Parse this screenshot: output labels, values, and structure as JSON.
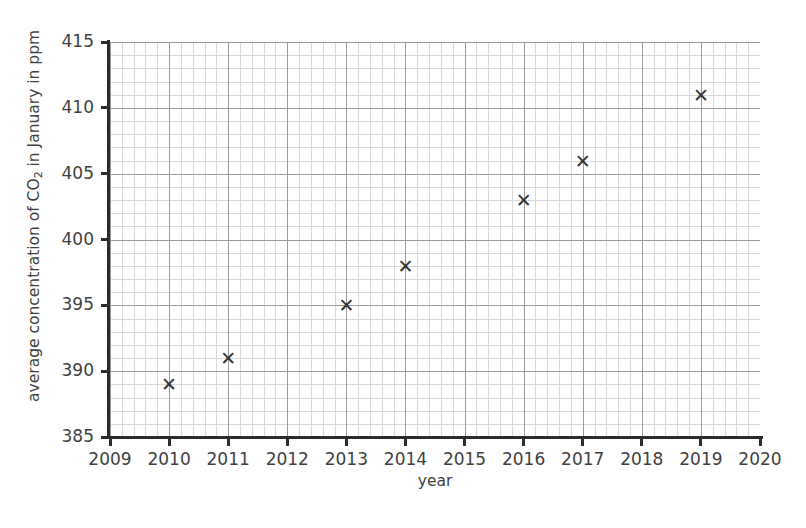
{
  "chart_data": {
    "type": "scatter",
    "title": "",
    "xlabel": "year",
    "ylabel": "average concentration of CO2 in January in ppm",
    "ylabel_parts": {
      "before": "average concentration of CO",
      "sub": "2",
      "after": " in January in ppm"
    },
    "x": [
      2010,
      2011,
      2013,
      2014,
      2016,
      2017,
      2019
    ],
    "values": [
      389,
      391,
      395,
      398,
      403,
      406,
      411
    ],
    "points": [
      {
        "x": 2010,
        "y": 389
      },
      {
        "x": 2011,
        "y": 391
      },
      {
        "x": 2013,
        "y": 395
      },
      {
        "x": 2014,
        "y": 398
      },
      {
        "x": 2016,
        "y": 403
      },
      {
        "x": 2017,
        "y": 406
      },
      {
        "x": 2019,
        "y": 411
      }
    ],
    "xlim": [
      2009,
      2020
    ],
    "ylim": [
      385,
      415
    ],
    "xticks": [
      2009,
      2010,
      2011,
      2012,
      2013,
      2014,
      2015,
      2016,
      2017,
      2018,
      2019,
      2020
    ],
    "yticks": [
      385,
      390,
      395,
      400,
      405,
      410,
      415
    ],
    "xticklabels": [
      "2009",
      "2010",
      "2011",
      "2012",
      "2013",
      "2014",
      "2015",
      "2016",
      "2017",
      "2018",
      "2019",
      "2020"
    ],
    "yticklabels": [
      "385",
      "390",
      "395",
      "400",
      "405",
      "410",
      "415"
    ],
    "x_minor_step": 0.2,
    "y_minor_step": 1,
    "grid": true,
    "grid_minor": true,
    "legend": null,
    "marker": "x",
    "marker_color": "#333333",
    "major_grid_color": "#9a9a9a",
    "minor_grid_color": "#d8d8d8",
    "axis_color": "#2b2b2b",
    "background_color": "#ffffff"
  }
}
